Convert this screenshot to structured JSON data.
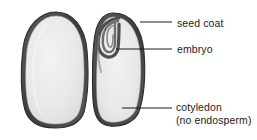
{
  "figure": {
    "background_color": "#ffffff"
  },
  "colors": {
    "seed_coat": "#4a4a4a",
    "seed_coat_outline": "#2f2f2f",
    "cotyledon_fill": "#e9e9e7",
    "embryo_dark": "#5b5b5b",
    "leader_line": "#1b1b1b",
    "text": "#1b1b1b"
  },
  "labels": [
    {
      "id": "seed-coat",
      "text": "seed coat",
      "text_line2": "",
      "leader": {
        "x1": 140,
        "y1": 22,
        "x2": 172,
        "y2": 22
      }
    },
    {
      "id": "embryo",
      "text": "embryo",
      "text_line2": "",
      "leader": {
        "x1": 116,
        "y1": 49,
        "x2": 172,
        "y2": 49
      }
    },
    {
      "id": "cotyledon",
      "text": "cotyledon",
      "text_line2": "(no endosperm)",
      "leader": {
        "x1": 122,
        "y1": 108,
        "x2": 172,
        "y2": 108
      }
    }
  ],
  "structures": [
    {
      "id": "left-cotyledon",
      "name": "cotyledon-left-half",
      "bounds": {
        "x": 22,
        "y": 12,
        "width": 66,
        "height": 116
      }
    },
    {
      "id": "right-cotyledon",
      "name": "cotyledon-right-half",
      "bounds": {
        "x": 92,
        "y": 13,
        "width": 53,
        "height": 113
      }
    },
    {
      "id": "embryo-hook",
      "name": "embryo-hooked-axis",
      "bounds": {
        "x": 96,
        "y": 16,
        "width": 28,
        "height": 42
      }
    }
  ]
}
